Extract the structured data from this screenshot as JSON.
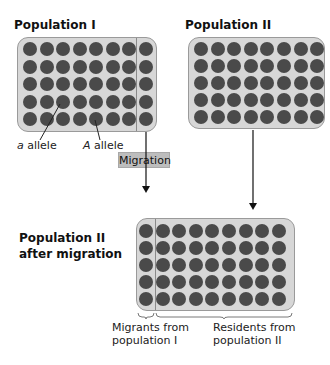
{
  "titles": {
    "pop1": "Population I",
    "pop2": "Population II",
    "after_line1": "Population II",
    "after_line2": "after migration"
  },
  "labels": {
    "a_allele_letter": "a",
    "a_allele_word": " allele",
    "A_allele_letter": "A",
    "A_allele_word": " allele",
    "migration": "Migration",
    "migrants_line1": "Migrants from",
    "migrants_line2": "population I",
    "residents_line1": "Residents from",
    "residents_line2": "population II"
  },
  "grids": {
    "pop1": {
      "rows": 5,
      "cols": 8,
      "divider_after_col": 7
    },
    "pop2": {
      "rows": 5,
      "cols": 8
    },
    "after": {
      "rows": 5,
      "cols": 9,
      "divider_after_col": 1
    }
  },
  "colors": {
    "box_fill": "#d7d7d7",
    "dot": "#4a4a4a",
    "migration_fill": "#bdbdbd"
  }
}
